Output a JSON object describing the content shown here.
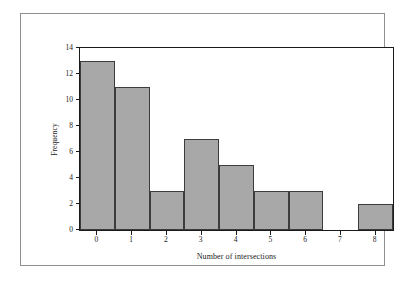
{
  "chart_data": {
    "type": "bar",
    "title": "",
    "subtitle": "",
    "xlabel": "Number of intersections",
    "ylabel": "Frequency",
    "categories": [
      "0",
      "1",
      "2",
      "3",
      "4",
      "5",
      "6",
      "7",
      "8"
    ],
    "values": [
      13,
      11,
      3,
      7,
      5,
      3,
      3,
      0,
      2
    ],
    "series": [
      {
        "name": "Frequency",
        "values": [
          13,
          11,
          3,
          7,
          5,
          3,
          3,
          0,
          2
        ]
      }
    ],
    "xlim": [
      -0.5,
      8.5
    ],
    "ylim": [
      0,
      14
    ],
    "y_ticks": [
      0,
      2,
      4,
      6,
      8,
      10,
      12,
      14
    ],
    "y_tick_labels": [
      "0",
      "2",
      "4",
      "6",
      "8",
      "10",
      "12",
      "14"
    ],
    "x_ticks": [
      0,
      1,
      2,
      3,
      4,
      5,
      6,
      7,
      8
    ],
    "x_tick_labels": [
      "0",
      "1",
      "2",
      "3",
      "4",
      "5",
      "6",
      "7",
      "8"
    ],
    "grid": false,
    "legend": false,
    "legend_position": "none",
    "bar_fill_color": "#a8a8a8",
    "bar_edge_color": "#3c3c3c",
    "axis_color": "#1a1a1a",
    "frame_color": "#8f8f8f",
    "background_color": "#ffffff",
    "bar_gap": 0,
    "annotations": []
  }
}
